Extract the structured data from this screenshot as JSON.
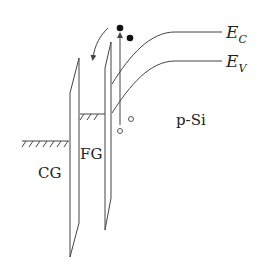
{
  "diagram": {
    "labels": {
      "conduction_band_main": "E",
      "conduction_band_sub": "C",
      "valence_band_main": "E",
      "valence_band_sub": "V",
      "substrate": "p-Si",
      "floating_gate": "FG",
      "control_gate": "CG"
    },
    "colors": {
      "line": "#444444",
      "background": "#ffffff"
    },
    "symbols": {
      "electrons": 2,
      "holes": 2
    }
  }
}
